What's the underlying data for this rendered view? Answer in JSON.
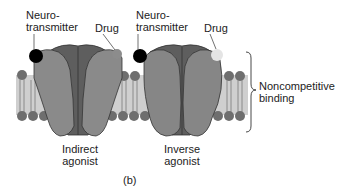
{
  "figure": {
    "panel_label": "(b)",
    "colors": {
      "receptor_dark": "#5a5a5a",
      "receptor_mid": "#7a7a7a",
      "receptor_light": "#8e8e8e",
      "membrane_band": "#c8c8c8",
      "lipid_head": "#6e6e6e",
      "neurotransmitter": "#000000",
      "drug_indirect": "#8a8a8a",
      "drug_inverse": "#e6e6e6"
    },
    "receptors": [
      {
        "name": "indirect-agonist",
        "top_left_label": "Neuro-\ntransmitter",
        "top_left_label_line1": "Neuro-",
        "top_left_label_line2": "transmitter",
        "top_right_label": "Drug",
        "bottom_label_line1": "Indirect",
        "bottom_label_line2": "agonist"
      },
      {
        "name": "inverse-agonist",
        "top_left_label_line1": "Neuro-",
        "top_left_label_line2": "transmitter",
        "top_right_label": "Drug",
        "bottom_label_line1": "Inverse",
        "bottom_label_line2": "agonist"
      }
    ],
    "brace_label_line1": "Noncompetitive",
    "brace_label_line2": "binding"
  }
}
